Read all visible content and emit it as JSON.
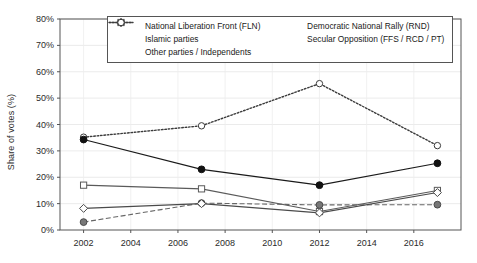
{
  "chart_data": {
    "type": "line",
    "title": "",
    "xlabel": "",
    "ylabel": "Share of votes (%)",
    "xlim": [
      2001,
      2018
    ],
    "ylim": [
      0,
      80
    ],
    "yticks": [
      "0%",
      "10%",
      "20%",
      "30%",
      "40%",
      "50%",
      "60%",
      "70%",
      "80%"
    ],
    "ytick_values": [
      0,
      10,
      20,
      30,
      40,
      50,
      60,
      70,
      80
    ],
    "xticks": [
      "2002",
      "2004",
      "2006",
      "2008",
      "2010",
      "2012",
      "2014",
      "2016"
    ],
    "xtick_values": [
      2002,
      2004,
      2006,
      2008,
      2010,
      2012,
      2014,
      2016
    ],
    "x": [
      2002,
      2007,
      2012,
      2017
    ],
    "grid": true,
    "legend_position": "top-center",
    "series": [
      {
        "name": "National Liberation Front (FLN)",
        "values": [
          34.3,
          23.0,
          17.0,
          25.3
        ],
        "marker": "filled-circle",
        "line": "solid",
        "color": "#1a1a1a"
      },
      {
        "name": "Democratic National Rally (RND)",
        "values": [
          8.2,
          10.0,
          6.5,
          14.2
        ],
        "marker": "open-diamond",
        "line": "solid",
        "color": "#4a4a4a"
      },
      {
        "name": "Islamic parties",
        "values": [
          17.0,
          15.6,
          7.0,
          15.0
        ],
        "marker": "open-square",
        "line": "solid",
        "color": "#5a5a5a"
      },
      {
        "name": "Secular Opposition (FFS / RCD / PT)",
        "values": [
          3.0,
          10.2,
          9.5,
          9.6
        ],
        "marker": "gray-circle",
        "line": "dashed",
        "color": "#666666"
      },
      {
        "name": "Other parties / Independents",
        "values": [
          35.2,
          39.5,
          55.5,
          32.0
        ],
        "marker": "open-circle",
        "line": "dotted",
        "color": "#3a3a3a"
      }
    ]
  },
  "legend": {
    "items": [
      {
        "label": "National Liberation Front (FLN)"
      },
      {
        "label": "Democratic National Rally (RND)"
      },
      {
        "label": "Islamic parties"
      },
      {
        "label": "Secular Opposition (FFS / RCD / PT)"
      },
      {
        "label": "Other parties / Independents"
      }
    ]
  }
}
